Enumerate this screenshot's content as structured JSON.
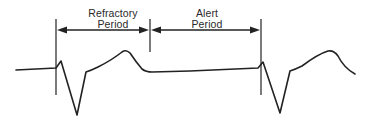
{
  "diagram": {
    "type": "ecg-timing",
    "stroke_color": "#222222",
    "background": "#ffffff",
    "labels": {
      "refractory": {
        "line1": "Refractory",
        "line2": "Period"
      },
      "alert": {
        "line1": "Alert",
        "line2": "Period"
      }
    },
    "markers": [
      {
        "name": "start-of-first-complex",
        "x": 56
      },
      {
        "name": "boundary-refractory-alert",
        "x": 150
      },
      {
        "name": "start-of-second-complex",
        "x": 261
      }
    ],
    "intervals": [
      {
        "name": "refractory-period",
        "from_marker": 0,
        "to_marker": 1
      },
      {
        "name": "alert-period",
        "from_marker": 1,
        "to_marker": 2
      }
    ]
  }
}
